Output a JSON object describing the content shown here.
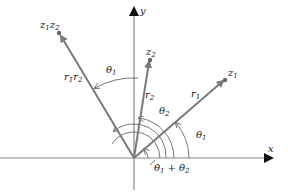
{
  "diagram": {
    "axes": {
      "x_label": "x",
      "y_label": "y"
    },
    "points": [
      {
        "name": "z1",
        "label_base": "z",
        "label_sub": "1"
      },
      {
        "name": "z2",
        "label_base": "z",
        "label_sub": "2"
      },
      {
        "name": "z1z2",
        "label_base1": "z",
        "label_sub1": "1",
        "label_base2": "z",
        "label_sub2": "2"
      }
    ],
    "moduli": {
      "r1": {
        "base": "r",
        "sub": "1"
      },
      "r2": {
        "base": "r",
        "sub": "2"
      },
      "r1r2": {
        "base1": "r",
        "sub1": "1",
        "base2": "r",
        "sub2": "2"
      }
    },
    "angles": {
      "theta1": {
        "base": "θ",
        "sub": "1"
      },
      "theta2": {
        "base": "θ",
        "sub": "2"
      },
      "theta_top": {
        "base": "θ",
        "sub": "1"
      },
      "sum": {
        "base1": "θ",
        "sub1": "1",
        "plus": "+",
        "base2": "θ",
        "sub2": "2"
      }
    },
    "colors": {
      "vector": "#7a7a7a",
      "axis": "#8a8a8a",
      "arc": "#555555"
    }
  }
}
